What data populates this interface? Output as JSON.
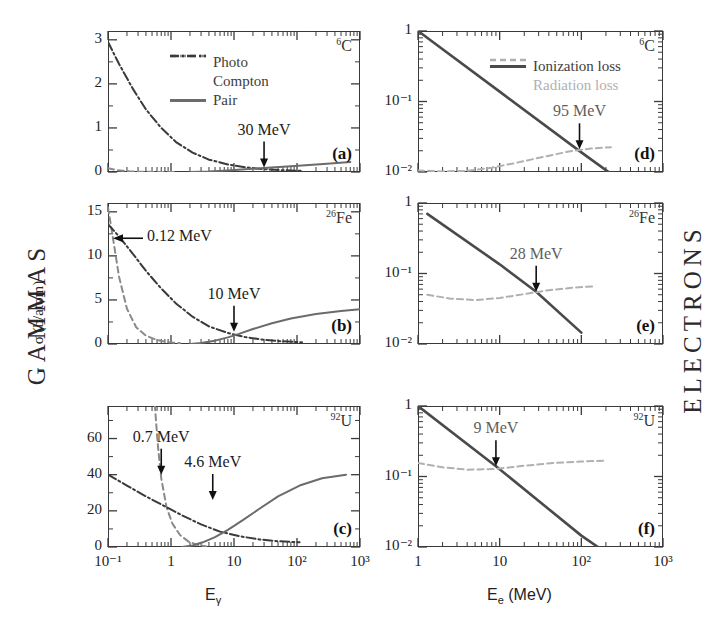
{
  "figure": {
    "left_column_label": "GAMMAS",
    "right_column_label": "ELECTRONS",
    "left_yaxis_title": "σ (b/atom)",
    "left_xaxis_title_base": "E",
    "left_xaxis_title_sub": "γ",
    "right_xaxis_title_base": "E",
    "right_xaxis_title_sub": "e",
    "right_xaxis_title_unit": "(MeV)"
  },
  "colors": {
    "axis": "#3a3a3a",
    "photo": "#8a8a8a",
    "compton": "#3a3a3a",
    "pair": "#6b6b6b",
    "ionization": "#4a4a4a",
    "radiation": "#b0b0b0",
    "text": "#2b2b2b"
  },
  "legends": {
    "gamma": [
      {
        "label": "Photo",
        "style": "dashed",
        "color": "#8a8a8a"
      },
      {
        "label": "Compton",
        "style": "dashdot",
        "color": "#3a3a3a"
      },
      {
        "label": "Pair",
        "style": "solid",
        "color": "#6b6b6b"
      }
    ],
    "electron": [
      {
        "label": "Ionization loss",
        "style": "solid",
        "color": "#4a4a4a"
      },
      {
        "label": "Radiation loss",
        "style": "dashed",
        "color": "#b0b0b0"
      }
    ]
  },
  "chart_data": [
    {
      "id": "a",
      "panel_label": "(a)",
      "type": "line",
      "column": "gammas",
      "element_z": "6",
      "element_symbol": "C",
      "title": "",
      "xlabel": "Eγ",
      "ylabel": "σ (b/atom)",
      "xscale": "log",
      "yscale": "linear",
      "xlim": [
        0.1,
        1000
      ],
      "ylim": [
        0,
        3.2
      ],
      "xticks": [
        "10⁻¹",
        "1",
        "10",
        "10²",
        "10³"
      ],
      "yticks": [
        "0",
        "1",
        "2",
        "3"
      ],
      "grid": false,
      "annotations": [
        {
          "text": "30 MeV",
          "x": 30,
          "y": 0.1,
          "arrow": "down"
        }
      ],
      "series": [
        {
          "name": "Photo",
          "style": "dashed",
          "color": "#8a8a8a",
          "x": [
            0.1,
            0.13,
            0.17,
            0.22,
            0.3,
            0.4,
            0.55,
            0.8,
            1.2
          ],
          "y": [
            0.085,
            0.05,
            0.028,
            0.016,
            0.008,
            0.004,
            0.002,
            0.001,
            0.0005
          ]
        },
        {
          "name": "Compton",
          "style": "dashdot",
          "color": "#3a3a3a",
          "x": [
            0.1,
            0.15,
            0.25,
            0.4,
            0.7,
            1.2,
            2.2,
            4,
            8,
            15,
            30,
            60,
            120
          ],
          "y": [
            2.95,
            2.45,
            1.88,
            1.42,
            1.0,
            0.68,
            0.44,
            0.28,
            0.17,
            0.105,
            0.065,
            0.04,
            0.025
          ]
        },
        {
          "name": "Pair",
          "style": "solid",
          "color": "#6b6b6b",
          "x": [
            2,
            4,
            8,
            15,
            30,
            60,
            120,
            300,
            700
          ],
          "y": [
            0.0,
            0.012,
            0.035,
            0.06,
            0.09,
            0.12,
            0.15,
            0.19,
            0.225
          ]
        }
      ]
    },
    {
      "id": "b",
      "panel_label": "(b)",
      "type": "line",
      "column": "gammas",
      "element_z": "26",
      "element_symbol": "Fe",
      "title": "",
      "xlabel": "Eγ",
      "ylabel": "σ (b/atom)",
      "xscale": "log",
      "yscale": "linear",
      "xlim": [
        0.1,
        1000
      ],
      "ylim": [
        0,
        16
      ],
      "xticks": [
        "10⁻¹",
        "1",
        "10",
        "10²",
        "10³"
      ],
      "yticks": [
        "0",
        "5",
        "10",
        "15"
      ],
      "grid": false,
      "annotations": [
        {
          "text": "0.12 MeV",
          "x": 0.12,
          "y": 12,
          "arrow": "left"
        },
        {
          "text": "10 MeV",
          "x": 10,
          "y": 1.4,
          "arrow": "down"
        }
      ],
      "series": [
        {
          "name": "Photo",
          "style": "dashed",
          "color": "#8a8a8a",
          "x": [
            0.1,
            0.12,
            0.15,
            0.2,
            0.28,
            0.4,
            0.6,
            0.9,
            1.4
          ],
          "y": [
            15.5,
            12.0,
            7.6,
            4.0,
            1.9,
            0.95,
            0.45,
            0.2,
            0.08
          ]
        },
        {
          "name": "Compton",
          "style": "dashdot",
          "color": "#3a3a3a",
          "x": [
            0.1,
            0.15,
            0.25,
            0.4,
            0.7,
            1.2,
            2.2,
            4,
            8,
            15,
            30,
            60,
            120
          ],
          "y": [
            13.6,
            12.2,
            10.2,
            8.3,
            6.3,
            4.6,
            3.1,
            2.0,
            1.25,
            0.78,
            0.48,
            0.3,
            0.2
          ]
        },
        {
          "name": "Pair",
          "style": "solid",
          "color": "#6b6b6b",
          "x": [
            2,
            3,
            5,
            8,
            12,
            20,
            40,
            80,
            200,
            500,
            1000
          ],
          "y": [
            0.0,
            0.12,
            0.38,
            0.75,
            1.15,
            1.7,
            2.35,
            2.9,
            3.4,
            3.75,
            3.95
          ]
        }
      ]
    },
    {
      "id": "c",
      "panel_label": "(c)",
      "type": "line",
      "column": "gammas",
      "element_z": "92",
      "element_symbol": "U",
      "title": "",
      "xlabel": "Eγ",
      "ylabel": "σ (b/atom)",
      "xscale": "log",
      "yscale": "linear",
      "xlim": [
        0.1,
        1000
      ],
      "ylim": [
        0,
        78
      ],
      "xticks": [
        "10⁻¹",
        "1",
        "10",
        "10²",
        "10³"
      ],
      "yticks": [
        "0",
        "20",
        "40",
        "60"
      ],
      "grid": false,
      "annotations": [
        {
          "text": "0.7 MeV",
          "x": 0.7,
          "y": 40,
          "arrow": "down"
        },
        {
          "text": "4.6 MeV",
          "x": 4.6,
          "y": 26,
          "arrow": "down"
        }
      ],
      "series": [
        {
          "name": "Photo",
          "style": "dashed",
          "color": "#8a8a8a",
          "x": [
            0.52,
            0.56,
            0.62,
            0.7,
            0.85,
            1.05,
            1.4,
            1.9,
            2.6,
            3.6
          ],
          "y": [
            90,
            76,
            56,
            38,
            22,
            13,
            6.5,
            3.0,
            1.2,
            0.4
          ]
        },
        {
          "name": "Compton",
          "style": "dashdot",
          "color": "#3a3a3a",
          "x": [
            0.1,
            0.2,
            0.4,
            0.8,
            1.5,
            3,
            6,
            12,
            25,
            50,
            110
          ],
          "y": [
            40,
            34,
            28,
            22.5,
            17.5,
            12.5,
            8.5,
            6.0,
            4.2,
            3.2,
            2.6
          ]
        },
        {
          "name": "Pair",
          "style": "solid",
          "color": "#6b6b6b",
          "x": [
            1.5,
            2.2,
            3.2,
            5,
            8,
            14,
            25,
            50,
            110,
            250,
            600
          ],
          "y": [
            0.0,
            0.8,
            2.6,
            5.5,
            9.5,
            15,
            21,
            28,
            34,
            38,
            40
          ]
        }
      ]
    },
    {
      "id": "d",
      "panel_label": "(d)",
      "type": "line",
      "column": "electrons",
      "element_z": "6",
      "element_symbol": "C",
      "title": "",
      "xlabel": "Ee (MeV)",
      "ylabel": "",
      "xscale": "log",
      "yscale": "log",
      "xlim": [
        1,
        1000
      ],
      "ylim": [
        0.01,
        1
      ],
      "xticks": [
        "1",
        "10",
        "10²",
        "10³"
      ],
      "yticks": [
        "10⁻²",
        "10⁻¹",
        "1"
      ],
      "grid": false,
      "annotations": [
        {
          "text": "95 MeV",
          "x": 95,
          "y": 0.021,
          "arrow": "down"
        }
      ],
      "series": [
        {
          "name": "Ionization loss",
          "style": "solid",
          "color": "#4a4a4a",
          "x": [
            1,
            10,
            100,
            220
          ],
          "y": [
            1.0,
            0.138,
            0.019,
            0.0098
          ]
        },
        {
          "name": "Radiation loss",
          "style": "dashed",
          "color": "#b0b0b0",
          "x": [
            1,
            2,
            4,
            8,
            16,
            35,
            70,
            130,
            230
          ],
          "y": [
            0.0105,
            0.0102,
            0.0104,
            0.0115,
            0.0135,
            0.0165,
            0.0195,
            0.0215,
            0.0225
          ]
        }
      ]
    },
    {
      "id": "e",
      "panel_label": "(e)",
      "type": "line",
      "column": "electrons",
      "element_z": "26",
      "element_symbol": "Fe",
      "title": "",
      "xlabel": "Ee (MeV)",
      "ylabel": "",
      "xscale": "log",
      "yscale": "log",
      "xlim": [
        1,
        1000
      ],
      "ylim": [
        0.01,
        1
      ],
      "xticks": [
        "1",
        "10",
        "10²",
        "10³"
      ],
      "yticks": [
        "10⁻²",
        "10⁻¹",
        "1"
      ],
      "grid": false,
      "annotations": [
        {
          "text": "28 MeV",
          "x": 28,
          "y": 0.055,
          "arrow": "down"
        }
      ],
      "series": [
        {
          "name": "Ionization loss",
          "style": "solid",
          "color": "#4a4a4a",
          "x": [
            1.3,
            10,
            28,
            100
          ],
          "y": [
            0.7,
            0.135,
            0.055,
            0.0145
          ]
        },
        {
          "name": "Radiation loss",
          "style": "dashed",
          "color": "#b0b0b0",
          "x": [
            1.3,
            2.5,
            5,
            10,
            20,
            40,
            80,
            150
          ],
          "y": [
            0.05,
            0.044,
            0.042,
            0.045,
            0.051,
            0.058,
            0.063,
            0.066
          ]
        }
      ]
    },
    {
      "id": "f",
      "panel_label": "(f)",
      "type": "line",
      "column": "electrons",
      "element_z": "92",
      "element_symbol": "U",
      "title": "",
      "xlabel": "Ee (MeV)",
      "ylabel": "",
      "xscale": "log",
      "yscale": "log",
      "xlim": [
        1,
        1000
      ],
      "ylim": [
        0.01,
        1
      ],
      "xticks": [
        "1",
        "10",
        "10²",
        "10³"
      ],
      "yticks": [
        "10⁻²",
        "10⁻¹",
        "1"
      ],
      "grid": false,
      "annotations": [
        {
          "text": "9 MeV",
          "x": 9,
          "y": 0.14,
          "arrow": "down"
        }
      ],
      "series": [
        {
          "name": "Ionization loss",
          "style": "solid",
          "color": "#4a4a4a",
          "x": [
            1,
            9,
            100,
            170
          ],
          "y": [
            1.0,
            0.14,
            0.0145,
            0.0095
          ]
        },
        {
          "name": "Radiation loss",
          "style": "dashed",
          "color": "#b0b0b0",
          "x": [
            1,
            2,
            4,
            9,
            20,
            45,
            100,
            200
          ],
          "y": [
            0.155,
            0.135,
            0.125,
            0.128,
            0.142,
            0.155,
            0.163,
            0.168
          ]
        }
      ]
    }
  ]
}
